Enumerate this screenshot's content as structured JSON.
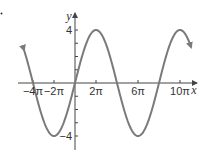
{
  "chart_data": {
    "type": "line",
    "title": "",
    "function": "y = 4 sin(x/4)",
    "xlabel": "x",
    "ylabel": "y",
    "x_range_pi": [
      -4.86,
      11.05
    ],
    "ylim": [
      -5,
      5
    ],
    "x_ticks": [
      {
        "value_pi": -4,
        "label": "−4π"
      },
      {
        "value_pi": -2,
        "label": "−2π"
      },
      {
        "value_pi": 2,
        "label": "2π"
      },
      {
        "value_pi": 6,
        "label": "6π"
      },
      {
        "value_pi": 10,
        "label": "10π"
      }
    ],
    "y_ticks": [
      {
        "value": 4,
        "label": "4"
      },
      {
        "value": -4,
        "label": "−4"
      }
    ],
    "y_minor_ticks": [
      -4,
      -3,
      -2,
      -1,
      1,
      2,
      3,
      4
    ],
    "key_points": [
      {
        "x_pi": -4,
        "y": 0
      },
      {
        "x_pi": -2,
        "y": -4
      },
      {
        "x_pi": 0,
        "y": 0
      },
      {
        "x_pi": 2,
        "y": 4
      },
      {
        "x_pi": 4,
        "y": 0
      },
      {
        "x_pi": 6,
        "y": -4
      },
      {
        "x_pi": 8,
        "y": 0
      },
      {
        "x_pi": 10,
        "y": 4
      }
    ],
    "grid": false,
    "legend": null,
    "curve_color": "#7a7a7a",
    "axis_color": "#444444"
  }
}
